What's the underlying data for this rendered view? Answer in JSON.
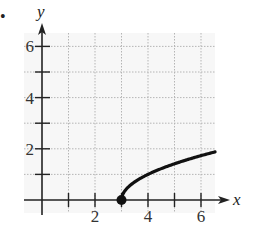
{
  "problem": {
    "bullet": "•"
  },
  "chart_data": {
    "type": "line",
    "title": "",
    "xlabel": "x",
    "ylabel": "y",
    "xlim": [
      -0.7,
      6.5
    ],
    "ylim": [
      -0.5,
      6.6
    ],
    "x_ticks": [
      1,
      2,
      3,
      4,
      5,
      6
    ],
    "x_tick_labels": [
      "",
      "2",
      "",
      "4",
      "",
      "6"
    ],
    "y_ticks": [
      1,
      2,
      3,
      4,
      5,
      6
    ],
    "y_tick_labels": [
      "",
      "2",
      "",
      "4",
      "",
      "6"
    ],
    "grid": true,
    "series": [
      {
        "name": "y = sqrt(x - 3)",
        "x": [
          3,
          3.05,
          3.2,
          3.5,
          4,
          4.5,
          5,
          5.5,
          6,
          6.5
        ],
        "values": [
          0,
          0.22,
          0.45,
          0.71,
          1.0,
          1.22,
          1.41,
          1.58,
          1.73,
          1.87
        ],
        "start_point": {
          "x": 3,
          "y": 0,
          "style": "closed-dot"
        }
      }
    ],
    "colors": {
      "axis": "#222222",
      "grid": "#b5b5b5",
      "curve": "#111111",
      "background": "#f5f5f5"
    }
  }
}
